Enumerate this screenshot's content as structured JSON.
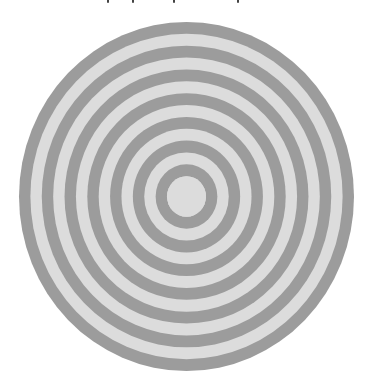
{
  "image": {
    "description": "Concentric ring target pattern (alternating gray and light gray rings)",
    "cropped_text_fragment_marks_x": [
      107,
      132,
      173,
      237
    ]
  },
  "target": {
    "center_x": 186.5,
    "center_y": 196.5,
    "outer_radius_x": 167.5,
    "outer_radius_y": 174.5,
    "dark_ring_count": 7,
    "light_ring_count": 6,
    "band_count": 14,
    "center_disc_radius_x": 19.5,
    "colors": {
      "dark": "#9c9c9c",
      "light": "#dcdcdc",
      "background": "#ffffff"
    }
  }
}
